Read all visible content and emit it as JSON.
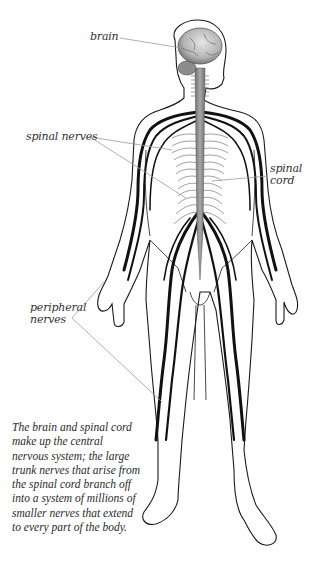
{
  "diagram": {
    "colors": {
      "background": "#ffffff",
      "outline": "#1a1a1a",
      "nerve": "#111111",
      "spinal_cord": "#8a8a8a",
      "brain": "#b9b9b9",
      "leader_line": "#9a9a9a",
      "label_text": "#333333"
    },
    "labels": {
      "brain": "brain",
      "spinal_nerves": "spinal nerves",
      "spinal_cord_line1": "spinal",
      "spinal_cord_line2": "cord",
      "peripheral_line1": "peripheral",
      "peripheral_line2": "nerves"
    },
    "caption": "The brain and spinal cord make up the central nervous system; the large trunk nerves that arise from the spinal cord branch off into a system of millions of smaller nerves that extend to every part of the body."
  }
}
